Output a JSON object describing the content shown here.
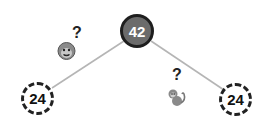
{
  "diagram": {
    "type": "binary-tree",
    "root": {
      "value": "42",
      "style": "solid-dark",
      "fill": "#6b6b6b",
      "border": "#1e1e1e"
    },
    "children": [
      {
        "value": "24",
        "style": "dashed",
        "position": "left"
      },
      {
        "value": "24",
        "style": "dashed",
        "position": "right"
      }
    ],
    "edge_color": "#b5b5b5",
    "annotations": [
      {
        "icon": "monkey-face-icon",
        "label": "?",
        "near": "left-edge"
      },
      {
        "icon": "monkey-icon",
        "label": "?",
        "near": "right-edge"
      }
    ]
  }
}
